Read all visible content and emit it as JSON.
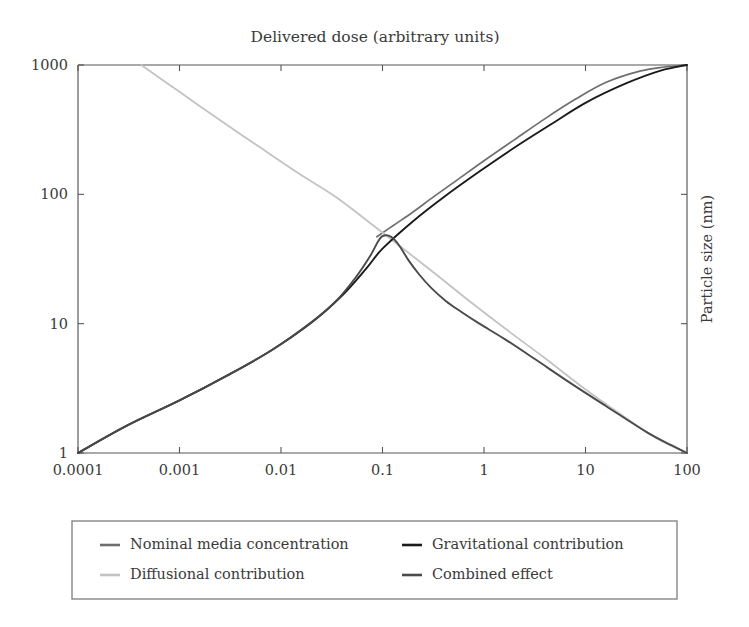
{
  "chart_data": {
    "type": "line",
    "title": "Delivered dose (arbitrary units)",
    "xlabel": "",
    "ylabel": "Particle size  (nm)",
    "xscale": "log",
    "yscale": "log",
    "xlim": [
      0.0001,
      100
    ],
    "ylim": [
      1,
      1000
    ],
    "grid": false,
    "legend_position": "below-plot",
    "xticks": [
      0.0001,
      0.001,
      0.01,
      0.1,
      1,
      10,
      100
    ],
    "xtick_labels": [
      "0.0001",
      "0.001",
      "0.01",
      "0.1",
      "1",
      "10",
      "100"
    ],
    "yticks": [
      1,
      10,
      100,
      1000
    ],
    "ytick_labels": [
      "1",
      "10",
      "100",
      "1000"
    ],
    "series": [
      {
        "name": "Nominal media concentration",
        "color": "#6e6e6e",
        "width": 1.7,
        "points": [
          [
            0.088,
            47.0
          ],
          [
            0.13,
            58.0
          ],
          [
            0.2,
            73.0
          ],
          [
            0.32,
            96.0
          ],
          [
            0.55,
            130.0
          ],
          [
            1.0,
            182.0
          ],
          [
            2.0,
            265.0
          ],
          [
            4.0,
            385.0
          ],
          [
            8.0,
            545.0
          ],
          [
            16.0,
            735.0
          ],
          [
            35.0,
            900.0
          ],
          [
            60.0,
            965.0
          ],
          [
            100.0,
            1000.0
          ]
        ]
      },
      {
        "name": "Diffusional contribution",
        "color": "#c3c3c3",
        "width": 1.8,
        "points": [
          [
            0.00042,
            1000.0
          ],
          [
            0.001,
            620.0
          ],
          [
            0.0025,
            375.0
          ],
          [
            0.006,
            235.0
          ],
          [
            0.015,
            145.0
          ],
          [
            0.035,
            95.0
          ],
          [
            0.08,
            58.0
          ],
          [
            0.16,
            38.0
          ],
          [
            0.35,
            23.5
          ],
          [
            0.8,
            14.0
          ],
          [
            1.8,
            8.6
          ],
          [
            4.0,
            5.4
          ],
          [
            9.0,
            3.3
          ],
          [
            22.0,
            2.0
          ],
          [
            50.0,
            1.3
          ],
          [
            100.0,
            1.0
          ]
        ]
      },
      {
        "name": "Gravitational contribution",
        "color": "#1a1a1a",
        "width": 1.9,
        "points": [
          [
            0.0001,
            1.0
          ],
          [
            0.0003,
            1.62
          ],
          [
            0.001,
            2.55
          ],
          [
            0.003,
            4.0
          ],
          [
            0.008,
            6.2
          ],
          [
            0.02,
            10.2
          ],
          [
            0.04,
            16.5
          ],
          [
            0.07,
            27.0
          ],
          [
            0.1,
            38.0
          ],
          [
            0.2,
            62.0
          ],
          [
            0.4,
            95.0
          ],
          [
            0.9,
            150.0
          ],
          [
            2.0,
            230.0
          ],
          [
            4.5,
            345.0
          ],
          [
            10.0,
            510.0
          ],
          [
            25.0,
            720.0
          ],
          [
            55.0,
            905.0
          ],
          [
            100.0,
            1000.0
          ]
        ]
      },
      {
        "name": "Combined effect",
        "color": "#4a4a4a",
        "width": 1.9,
        "points": [
          [
            0.0001,
            1.0
          ],
          [
            0.0003,
            1.62
          ],
          [
            0.001,
            2.55
          ],
          [
            0.003,
            4.0
          ],
          [
            0.008,
            6.2
          ],
          [
            0.02,
            10.3
          ],
          [
            0.035,
            15.0
          ],
          [
            0.055,
            23.0
          ],
          [
            0.075,
            33.0
          ],
          [
            0.09,
            43.0
          ],
          [
            0.1,
            47.5
          ],
          [
            0.115,
            48.0
          ],
          [
            0.13,
            45.0
          ],
          [
            0.15,
            39.0
          ],
          [
            0.18,
            31.0
          ],
          [
            0.23,
            24.0
          ],
          [
            0.3,
            19.0
          ],
          [
            0.42,
            15.0
          ],
          [
            0.6,
            12.3
          ],
          [
            0.9,
            10.0
          ],
          [
            1.6,
            7.6
          ],
          [
            3.2,
            5.3
          ],
          [
            7.0,
            3.5
          ],
          [
            16.0,
            2.3
          ],
          [
            40.0,
            1.45
          ],
          [
            70.0,
            1.15
          ],
          [
            100.0,
            1.0
          ]
        ]
      }
    ],
    "legend_entries": [
      {
        "label": "Nominal media concentration",
        "color": "#6e6e6e"
      },
      {
        "label": "Gravitational contribution",
        "color": "#1a1a1a"
      },
      {
        "label": "Diffusional contribution",
        "color": "#c3c3c3"
      },
      {
        "label": "Combined effect",
        "color": "#4a4a4a"
      }
    ]
  },
  "layout": {
    "plot_left": 78,
    "plot_right": 687,
    "plot_top": 65,
    "plot_bottom": 453,
    "legend_x": 72,
    "legend_y": 521,
    "legend_w": 605,
    "legend_h": 78
  }
}
